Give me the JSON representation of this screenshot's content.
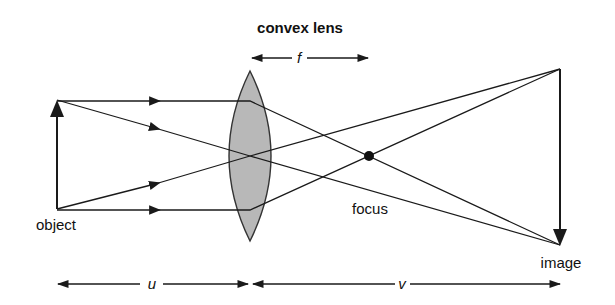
{
  "diagram": {
    "title": "convex lens",
    "labels": {
      "object": "object",
      "image": "image",
      "focus": "focus",
      "focal_length": "f",
      "object_distance": "u",
      "image_distance": "v"
    },
    "colors": {
      "line": "#1a1a1a",
      "lens_fill": "#b8b8b8",
      "lens_stroke": "#333333",
      "background": "#ffffff"
    },
    "geometry": {
      "object": {
        "x": 57,
        "top": 100,
        "bottom": 209
      },
      "lens": {
        "cx": 250,
        "top": 71,
        "bottom": 241,
        "half_width": 21
      },
      "focus": {
        "x": 369,
        "y": 156
      },
      "image": {
        "x": 560,
        "top": 69,
        "bottom": 245
      }
    }
  }
}
